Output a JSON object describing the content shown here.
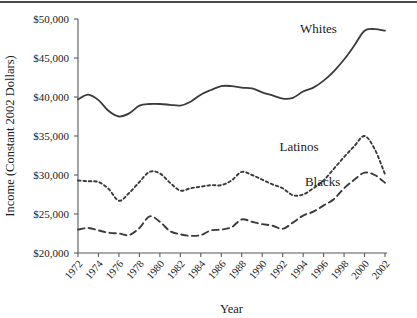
{
  "chart_data": {
    "type": "line",
    "title": "",
    "subtitle": "",
    "xlabel": "Year",
    "ylabel": "Income (Constant 2002 Dollars)",
    "xlim": [
      1972,
      2002
    ],
    "ylim": [
      20000,
      50000
    ],
    "grid": false,
    "legend_position": "inline-annotations",
    "ytick_labels": [
      "$50,000",
      "$45,000",
      "$40,000",
      "$35,000",
      "$30,000",
      "$25,000",
      "$20,000"
    ],
    "ytick_values": [
      50000,
      45000,
      40000,
      35000,
      30000,
      25000,
      20000
    ],
    "xtick_labels": [
      "1972",
      "1974",
      "1976",
      "1978",
      "1980",
      "1982",
      "1984",
      "1986",
      "1988",
      "1990",
      "1992",
      "1994",
      "1996",
      "1998",
      "2000",
      "2002"
    ],
    "xtick_values": [
      1972,
      1974,
      1976,
      1978,
      1980,
      1982,
      1984,
      1986,
      1988,
      1990,
      1992,
      1994,
      1996,
      1998,
      2000,
      2002
    ],
    "x": [
      1972,
      1973,
      1974,
      1975,
      1976,
      1977,
      1978,
      1979,
      1980,
      1981,
      1982,
      1983,
      1984,
      1985,
      1986,
      1987,
      1988,
      1989,
      1990,
      1991,
      1992,
      1993,
      1994,
      1995,
      1996,
      1997,
      1998,
      1999,
      2000,
      2001,
      2002
    ],
    "series": [
      {
        "name": "Whites",
        "style": "solid",
        "color": "#3b3b3f",
        "label_position": {
          "x": 1995.5,
          "y": 48200
        },
        "values": [
          39700,
          40300,
          39600,
          38200,
          37500,
          37900,
          38900,
          39100,
          39100,
          39000,
          38900,
          39400,
          40300,
          40900,
          41400,
          41400,
          41200,
          41100,
          40600,
          40200,
          39800,
          39900,
          40700,
          41200,
          42100,
          43300,
          44800,
          46600,
          48500,
          48700,
          48500
        ]
      },
      {
        "name": "Latinos",
        "style": "dotted",
        "color": "#3b3b3f",
        "label_position": {
          "x": 1993.6,
          "y": 33100
        },
        "values": [
          29300,
          29200,
          29100,
          28200,
          26700,
          27700,
          29100,
          30400,
          30200,
          29000,
          28000,
          28300,
          28500,
          28700,
          28700,
          29300,
          30400,
          30000,
          29400,
          28800,
          28300,
          27400,
          27500,
          28300,
          29300,
          30800,
          32300,
          33700,
          35000,
          33300,
          30100
        ]
      },
      {
        "name": "Blacks",
        "style": "dashed",
        "color": "#3b3b3f",
        "label_position": {
          "x": 1995.9,
          "y": 28600
        },
        "values": [
          23000,
          23200,
          22900,
          22600,
          22500,
          22300,
          23200,
          24700,
          24000,
          22800,
          22400,
          22200,
          22300,
          22900,
          23000,
          23300,
          24300,
          24000,
          23700,
          23500,
          23100,
          23900,
          24800,
          25300,
          26100,
          26900,
          28300,
          29400,
          30300,
          30000,
          29000
        ]
      }
    ]
  },
  "axis": {
    "x_title": "Year",
    "y_title": "Income (Constant 2002 Dollars)"
  }
}
